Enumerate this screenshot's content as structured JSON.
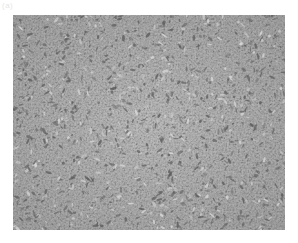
{
  "image": {
    "caption": "(a)",
    "description": "Phase-contrast micrograph of a confluent adherent cell culture monolayer",
    "colors": {
      "background": "#ffffff",
      "field": "#b9b9b9",
      "cell_dark": "#5a5a5a",
      "cell_light": "#dcdcdc"
    }
  }
}
